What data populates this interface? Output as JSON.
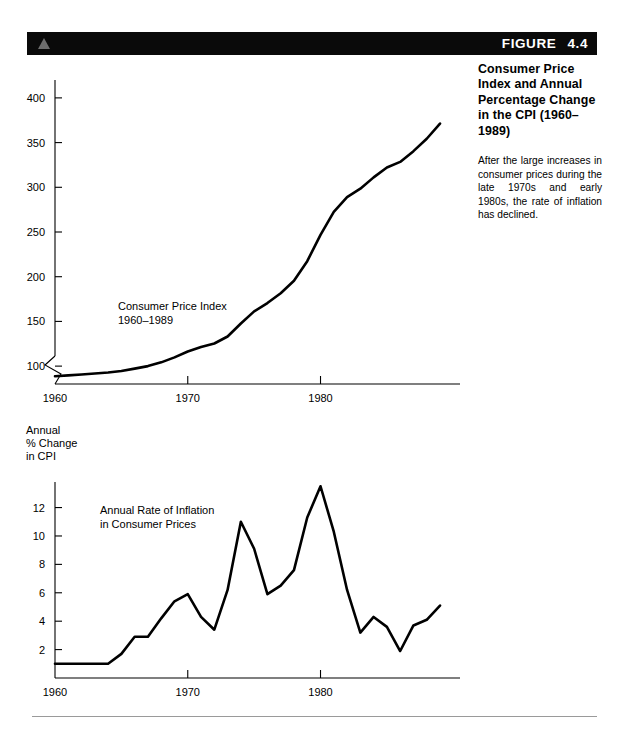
{
  "figure": {
    "label": "FIGURE",
    "number": "4.4",
    "triangle_icon": "triangle-up-icon",
    "band_color": "#0a0a0a",
    "triangle_color": "#6e6e6e"
  },
  "caption": {
    "title": "Consumer Price Index and Annual Percentage Change in the CPI (1960–1989)",
    "body": "After the large increases in consumer prices during the late 1970s and early 1980s, the rate of inflation has declined."
  },
  "footer": {
    "rule_color": "#9a9a9a"
  },
  "chart_data": [
    {
      "id": "cpi-level",
      "type": "line",
      "title": "",
      "series_label": "Consumer Price Index\n1960–1989",
      "series_label_line1": "Consumer Price Index",
      "series_label_line2": "1960–1989",
      "xlabel": "",
      "ylabel": "",
      "grid": false,
      "legend": "inline-label",
      "axis_break": true,
      "xlim": [
        1960,
        1989
      ],
      "ylim": [
        80,
        420
      ],
      "xticks": [
        1960,
        1970,
        1980
      ],
      "xticklabels": [
        "1960",
        "1970",
        "1980"
      ],
      "yticks": [
        100,
        150,
        200,
        250,
        300,
        350,
        400
      ],
      "yticklabels": [
        "100",
        "150",
        "200",
        "250",
        "300",
        "350",
        "400"
      ],
      "x": [
        1960,
        1961,
        1962,
        1963,
        1964,
        1965,
        1966,
        1967,
        1968,
        1969,
        1970,
        1971,
        1972,
        1973,
        1974,
        1975,
        1976,
        1977,
        1978,
        1979,
        1980,
        1981,
        1982,
        1983,
        1984,
        1985,
        1986,
        1987,
        1988,
        1989
      ],
      "values": [
        88.7,
        89.6,
        90.6,
        91.7,
        92.9,
        94.5,
        97.2,
        100.0,
        104.2,
        109.8,
        116.3,
        121.3,
        125.3,
        133.1,
        147.7,
        161.2,
        170.5,
        181.5,
        195.4,
        217.4,
        246.8,
        272.4,
        289.1,
        298.4,
        311.1,
        322.2,
        328.4,
        340.4,
        354.3,
        371.3
      ]
    },
    {
      "id": "cpi-annual-change",
      "type": "line",
      "title": "",
      "series_label_line1": "Annual Rate of Inflation",
      "series_label_line2": "in Consumer Prices",
      "ylabel_line1": "Annual",
      "ylabel_line2": "% Change",
      "ylabel_line3": "in CPI",
      "xlabel": "",
      "grid": false,
      "legend": "inline-label",
      "axis_break": false,
      "xlim": [
        1960,
        1989
      ],
      "ylim": [
        0,
        13.8
      ],
      "xticks": [
        1960,
        1970,
        1980
      ],
      "xticklabels": [
        "1960",
        "1970",
        "1980"
      ],
      "yticks": [
        2,
        4,
        6,
        8,
        10,
        12
      ],
      "yticklabels": [
        "2",
        "4",
        "6",
        "8",
        "10",
        "12"
      ],
      "x": [
        1960,
        1961,
        1962,
        1963,
        1964,
        1965,
        1966,
        1967,
        1968,
        1969,
        1970,
        1971,
        1972,
        1973,
        1974,
        1975,
        1976,
        1977,
        1978,
        1979,
        1980,
        1981,
        1982,
        1983,
        1984,
        1985,
        1986,
        1987,
        1988,
        1989
      ],
      "values": [
        1.0,
        1.0,
        1.0,
        1.0,
        1.0,
        1.7,
        2.9,
        2.9,
        4.2,
        5.4,
        5.9,
        4.3,
        3.4,
        6.2,
        11.0,
        9.1,
        5.9,
        6.5,
        7.6,
        11.3,
        13.5,
        10.3,
        6.2,
        3.2,
        4.3,
        3.6,
        1.9,
        3.7,
        4.1,
        5.1
      ]
    }
  ]
}
